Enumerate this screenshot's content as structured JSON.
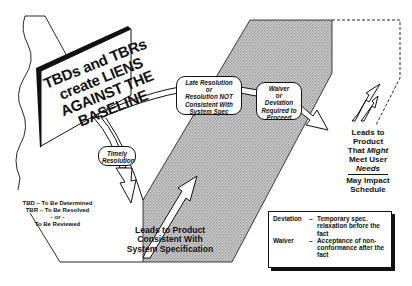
{
  "diagram": {
    "sign": {
      "lines": [
        "TBDs and TBRs",
        "create LIENS",
        "AGAINST THE",
        "BASELINE"
      ]
    },
    "bubbles": {
      "timely": [
        "Timely",
        "Resolution"
      ],
      "late": [
        "Late Resolution",
        "or",
        "Resolution NOT",
        "Consistent With",
        "System Spec"
      ],
      "waiver": [
        "Waiver",
        "or",
        "Deviation",
        "Required to",
        "Proceed"
      ]
    },
    "abbreviations": {
      "tbd": "TBD – To Be Determined",
      "tbr": "TBR – To Be Resolved",
      "or": "- or -",
      "reviewed": "To Be Reviewed"
    },
    "outcome_consistent": [
      "Leads to Product",
      "Consistent With",
      "System Specification"
    ],
    "outcome_might": {
      "line1": "Leads to",
      "line2": "Product",
      "line3_prefix": "That ",
      "line3_emph": "Might",
      "line4": "Meet User",
      "line5_emph": "Needs",
      "impact1": "May Impact",
      "impact2": "Schedule"
    },
    "definitions": [
      {
        "term": "Deviation",
        "dash": "–",
        "desc": "Temporary spec. relaxation before the fact"
      },
      {
        "term": "Waiver",
        "dash": "–",
        "desc": "Acceptance of non-conformance after the fact"
      }
    ],
    "colors": {
      "ink": "#111111",
      "band_fill": "#bdbdbd",
      "background": "#ffffff"
    }
  }
}
